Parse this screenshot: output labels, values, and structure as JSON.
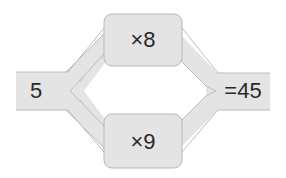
{
  "diagram": {
    "input": {
      "label": "5"
    },
    "top_op": {
      "label": "×8"
    },
    "bottom_op": {
      "label": "×9"
    },
    "output": {
      "label": "=45"
    }
  },
  "colors": {
    "fill": "#e4e4e4",
    "stroke": "#b8b8b8",
    "text": "#2a2a2a"
  }
}
